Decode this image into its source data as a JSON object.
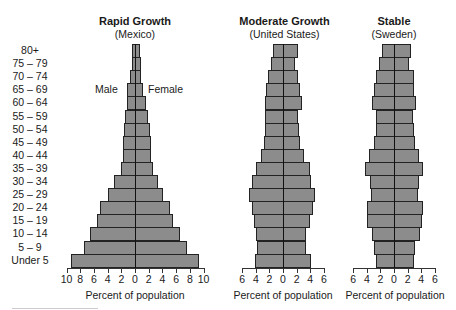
{
  "chart_data": [
    {
      "type": "bar",
      "orientation": "horizontal-population-pyramid",
      "title": "Rapid Growth",
      "subtitle": "(Mexico)",
      "xlabel": "Percent of population",
      "ylabel": "",
      "xlim": [
        -10,
        10
      ],
      "xticks": [
        "10",
        "8",
        "6",
        "4",
        "2",
        "0",
        "2",
        "4",
        "6",
        "8",
        "10"
      ],
      "legend": {
        "left": "Male",
        "right": "Female"
      },
      "categories": [
        "80+",
        "75 – 79",
        "70 – 74",
        "65 – 69",
        "60 – 64",
        "55 – 59",
        "50 – 54",
        "45 – 49",
        "40 – 44",
        "35 – 39",
        "30 – 34",
        "25 – 29",
        "20 – 24",
        "15 – 19",
        "10 – 14",
        "5 – 9",
        "Under 5"
      ],
      "series": [
        {
          "name": "Male",
          "values": [
            0.4,
            0.5,
            0.7,
            1.2,
            1.2,
            1.5,
            1.6,
            1.7,
            1.7,
            2.0,
            3.0,
            4.0,
            5.1,
            5.6,
            6.5,
            7.5,
            9.3
          ]
        },
        {
          "name": "Female",
          "values": [
            0.6,
            0.8,
            0.8,
            1.0,
            1.4,
            1.7,
            2.1,
            2.2,
            2.2,
            2.5,
            3.2,
            3.9,
            5.0,
            5.4,
            6.4,
            7.5,
            9.2
          ]
        }
      ]
    },
    {
      "type": "bar",
      "orientation": "horizontal-population-pyramid",
      "title": "Moderate Growth",
      "subtitle": "(United States)",
      "xlabel": "Percent of population",
      "ylabel": "",
      "xlim": [
        -6,
        6
      ],
      "xticks": [
        "6",
        "4",
        "2",
        "0",
        "2",
        "4",
        "6"
      ],
      "categories": [
        "80+",
        "75 – 79",
        "70 – 74",
        "65 – 69",
        "60 – 64",
        "55 – 59",
        "50 – 54",
        "45 – 49",
        "40 – 44",
        "35 – 39",
        "30 – 34",
        "25 – 29",
        "20 – 24",
        "15 – 19",
        "10 – 14",
        "5 – 9",
        "Under 5"
      ],
      "series": [
        {
          "name": "Male",
          "values": [
            1.4,
            1.8,
            2.2,
            2.5,
            2.6,
            2.7,
            2.7,
            2.8,
            3.2,
            4.0,
            4.5,
            5.0,
            4.5,
            4.2,
            3.9,
            3.8,
            4.1
          ]
        },
        {
          "name": "Female",
          "values": [
            2.1,
            1.6,
            2.0,
            2.4,
            2.7,
            2.1,
            2.2,
            2.4,
            2.9,
            3.8,
            4.0,
            4.5,
            4.3,
            3.8,
            3.3,
            3.3,
            3.9
          ]
        }
      ]
    },
    {
      "type": "bar",
      "orientation": "horizontal-population-pyramid",
      "title": "Stable",
      "subtitle": "(Sweden)",
      "xlabel": "Percent of population",
      "ylabel": "",
      "xlim": [
        -6,
        6
      ],
      "xticks": [
        "6",
        "4",
        "2",
        "0",
        "2",
        "4",
        "6"
      ],
      "categories": [
        "80+",
        "75 – 79",
        "70 – 74",
        "65 – 69",
        "60 – 64",
        "55 – 59",
        "50 – 54",
        "45 – 49",
        "40 – 44",
        "35 – 39",
        "30 – 34",
        "25 – 29",
        "20 – 24",
        "15 – 19",
        "10 – 14",
        "5 – 9",
        "Under 5"
      ],
      "series": [
        {
          "name": "Male",
          "values": [
            1.8,
            2.2,
            2.7,
            3.0,
            3.2,
            2.6,
            2.7,
            3.0,
            3.7,
            4.2,
            3.5,
            3.4,
            3.9,
            4.0,
            3.3,
            3.0,
            2.7
          ]
        },
        {
          "name": "Female",
          "values": [
            2.4,
            2.0,
            2.8,
            2.8,
            3.1,
            2.7,
            2.8,
            3.0,
            3.5,
            4.1,
            3.6,
            3.4,
            4.1,
            3.9,
            3.7,
            3.0,
            2.8
          ]
        }
      ]
    }
  ],
  "labels": {
    "male": "Male",
    "female": "Female"
  },
  "style": {
    "bar_fill": "#8c8c8c",
    "bar_border": "#222222"
  }
}
